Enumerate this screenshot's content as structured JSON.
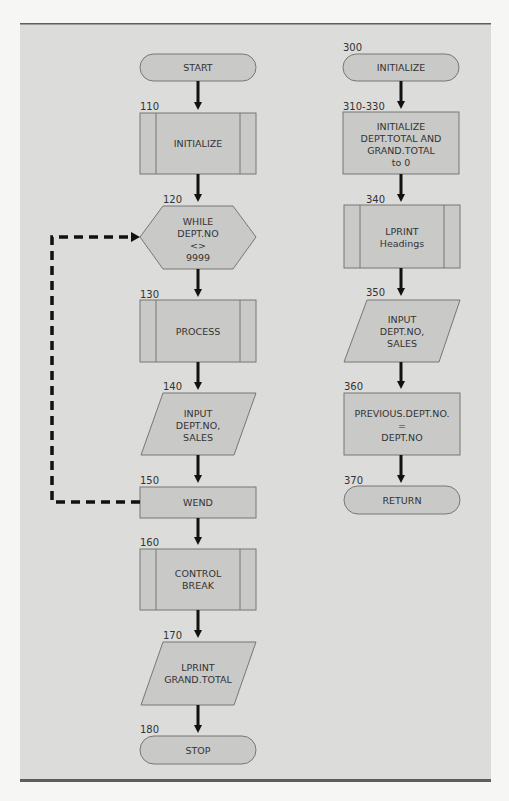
{
  "diagram": {
    "type": "flowchart",
    "colors": {
      "panel": "#dcdcda",
      "shape_fill": "#c9c9c7",
      "shape_stroke": "#777777",
      "arrow": "#111111",
      "rule": "#5e5e5e"
    },
    "main_flow": [
      {
        "id": "start",
        "step": "",
        "shape": "terminal",
        "lines": [
          "START"
        ]
      },
      {
        "id": "initialize",
        "step": "110",
        "shape": "predefined-process",
        "lines": [
          "INITIALIZE"
        ]
      },
      {
        "id": "while",
        "step": "120",
        "shape": "hexagon",
        "lines": [
          "WHILE",
          "DEPT.NO",
          "<>",
          "9999"
        ]
      },
      {
        "id": "process",
        "step": "130",
        "shape": "predefined-process",
        "lines": [
          "PROCESS"
        ]
      },
      {
        "id": "input",
        "step": "140",
        "shape": "parallelogram",
        "lines": [
          "INPUT",
          "DEPT.NO,",
          "SALES"
        ]
      },
      {
        "id": "wend",
        "step": "150",
        "shape": "process",
        "lines": [
          "WEND"
        ]
      },
      {
        "id": "control-break",
        "step": "160",
        "shape": "predefined-process",
        "lines": [
          "CONTROL",
          "BREAK"
        ]
      },
      {
        "id": "lprint-total",
        "step": "170",
        "shape": "parallelogram",
        "lines": [
          "LPRINT",
          "GRAND.TOTAL"
        ]
      },
      {
        "id": "stop",
        "step": "180",
        "shape": "terminal",
        "lines": [
          "STOP"
        ]
      }
    ],
    "subroutine": [
      {
        "id": "sub-initialize",
        "step": "300",
        "shape": "terminal",
        "lines": [
          "INITIALIZE"
        ]
      },
      {
        "id": "init-totals",
        "step": "310-330",
        "shape": "process",
        "lines": [
          "INITIALIZE",
          "DEPT.TOTAL AND",
          "GRAND.TOTAL",
          "to 0"
        ]
      },
      {
        "id": "lprint-headings",
        "step": "340",
        "shape": "predefined-process",
        "lines": [
          "LPRINT",
          "Headings"
        ]
      },
      {
        "id": "sub-input",
        "step": "350",
        "shape": "parallelogram",
        "lines": [
          "INPUT",
          "DEPT.NO,",
          "SALES"
        ]
      },
      {
        "id": "prev-dept",
        "step": "360",
        "shape": "process",
        "lines": [
          "PREVIOUS.DEPT.NO.",
          "=",
          "DEPT.NO"
        ]
      },
      {
        "id": "return",
        "step": "370",
        "shape": "terminal",
        "lines": [
          "RETURN"
        ]
      }
    ],
    "loop_edge": {
      "from": "wend",
      "to": "while",
      "style": "dashed"
    }
  }
}
